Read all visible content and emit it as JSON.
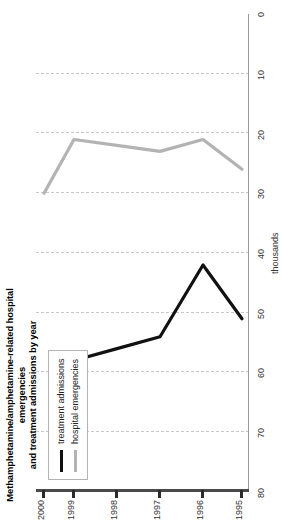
{
  "chart_data": {
    "type": "line",
    "title": "Methamphetamine/amphetamine-related hospital emergencies and treatment admissions by year",
    "xlabel": "",
    "ylabel": "thousands",
    "x": [
      "1995",
      "1996",
      "1997",
      "1998",
      "1999",
      "2000"
    ],
    "ylim": [
      0,
      80
    ],
    "yticks": [
      "0",
      "10",
      "20",
      "30",
      "40",
      "50",
      "60",
      "70",
      "80"
    ],
    "grid": true,
    "legend_position": "upper-left",
    "orientation": "rotated-90",
    "series": [
      {
        "name": "treatment admissions",
        "color": "#111111",
        "values": [
          51,
          42,
          54,
          56,
          58,
          null
        ]
      },
      {
        "name": "hospital emergencies",
        "color": "#b3b3b3",
        "values": [
          26,
          21,
          23,
          22,
          21,
          30
        ]
      }
    ]
  },
  "title": {
    "line1": "Methamphetamine/amphetamine-related hospital emergencies",
    "line2": "and treatment admissions by year"
  },
  "axes": {
    "y_caption": "thousands",
    "y_ticks": [
      "80",
      "70",
      "60",
      "50",
      "40",
      "30",
      "20",
      "10",
      "0"
    ],
    "x_ticks": [
      "1995",
      "1996",
      "1997",
      "1998",
      "1999",
      "2000"
    ]
  },
  "legend": {
    "items": [
      {
        "label": "treatment admissions",
        "swatch": "dark-line-swatch"
      },
      {
        "label": "hospital emergencies",
        "swatch": "light-line-swatch"
      }
    ]
  }
}
